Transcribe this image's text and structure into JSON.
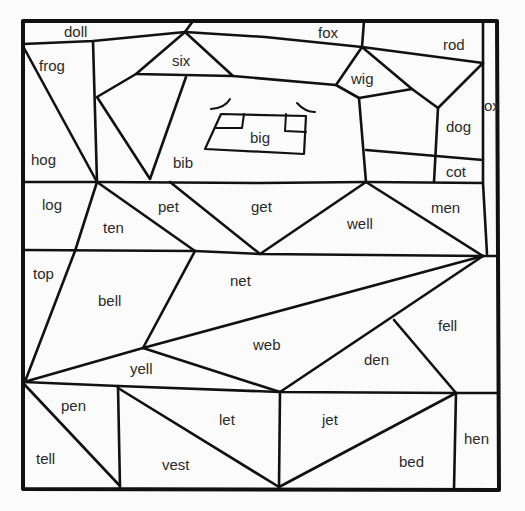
{
  "worksheet": {
    "type": "color-by-word puzzle",
    "colors": {
      "line": "#111111",
      "background": "#fbfbfb",
      "text": "#2a2a2a"
    },
    "regions": [
      {
        "word": "doll",
        "x": 64,
        "y": 24
      },
      {
        "word": "fox",
        "x": 318,
        "y": 25
      },
      {
        "word": "rod",
        "x": 443,
        "y": 37
      },
      {
        "word": "frog",
        "x": 39,
        "y": 58
      },
      {
        "word": "six",
        "x": 172,
        "y": 53
      },
      {
        "word": "wig",
        "x": 351,
        "y": 71
      },
      {
        "word": "ox",
        "x": 484,
        "y": 98
      },
      {
        "word": "big",
        "x": 250,
        "y": 130
      },
      {
        "word": "dog",
        "x": 446,
        "y": 119
      },
      {
        "word": "hog",
        "x": 31,
        "y": 152
      },
      {
        "word": "bib",
        "x": 173,
        "y": 155
      },
      {
        "word": "cot",
        "x": 446,
        "y": 164
      },
      {
        "word": "log",
        "x": 42,
        "y": 197
      },
      {
        "word": "pet",
        "x": 158,
        "y": 199
      },
      {
        "word": "get",
        "x": 251,
        "y": 199
      },
      {
        "word": "men",
        "x": 431,
        "y": 200
      },
      {
        "word": "ten",
        "x": 103,
        "y": 220
      },
      {
        "word": "well",
        "x": 347,
        "y": 216
      },
      {
        "word": "top",
        "x": 33,
        "y": 266
      },
      {
        "word": "net",
        "x": 230,
        "y": 273
      },
      {
        "word": "bell",
        "x": 98,
        "y": 293
      },
      {
        "word": "fell",
        "x": 438,
        "y": 318
      },
      {
        "word": "web",
        "x": 253,
        "y": 337
      },
      {
        "word": "den",
        "x": 364,
        "y": 352
      },
      {
        "word": "yell",
        "x": 130,
        "y": 361
      },
      {
        "word": "pen",
        "x": 61,
        "y": 398
      },
      {
        "word": "let",
        "x": 219,
        "y": 412
      },
      {
        "word": "jet",
        "x": 322,
        "y": 412
      },
      {
        "word": "hen",
        "x": 464,
        "y": 431
      },
      {
        "word": "tell",
        "x": 36,
        "y": 451
      },
      {
        "word": "bed",
        "x": 399,
        "y": 454
      },
      {
        "word": "vest",
        "x": 162,
        "y": 457
      }
    ]
  }
}
